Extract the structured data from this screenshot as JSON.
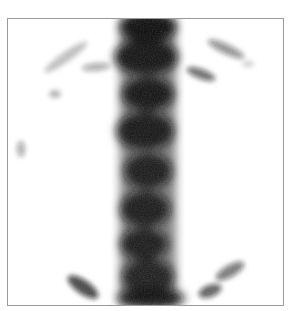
{
  "image": {
    "description": "Grayscale nuclear medicine scintigraphy (bone scan) showing a vertical spine with vertebral uptake and faint rib arcs",
    "colors": {
      "background": "#ffffff",
      "border": "#9a9a9a",
      "uptake": "#111111"
    }
  },
  "scan": {
    "vertebrae": [
      {
        "cx": 140,
        "cy": 8,
        "rx": 28,
        "ry": 16,
        "o": 0.95
      },
      {
        "cx": 138,
        "cy": 38,
        "rx": 32,
        "ry": 18,
        "o": 0.9
      },
      {
        "cx": 140,
        "cy": 75,
        "rx": 26,
        "ry": 17,
        "o": 0.9
      },
      {
        "cx": 137,
        "cy": 112,
        "rx": 29,
        "ry": 19,
        "o": 0.88
      },
      {
        "cx": 140,
        "cy": 152,
        "rx": 24,
        "ry": 18,
        "o": 0.85
      },
      {
        "cx": 137,
        "cy": 190,
        "rx": 25,
        "ry": 18,
        "o": 0.85
      },
      {
        "cx": 136,
        "cy": 225,
        "rx": 24,
        "ry": 16,
        "o": 0.85
      },
      {
        "cx": 140,
        "cy": 258,
        "rx": 26,
        "ry": 18,
        "o": 0.82
      },
      {
        "cx": 143,
        "cy": 279,
        "rx": 34,
        "ry": 10,
        "o": 0.9
      }
    ],
    "ribs": [
      {
        "cx": 58,
        "cy": 38,
        "rx": 26,
        "ry": 5,
        "rot": -35,
        "o": 0.25
      },
      {
        "cx": 88,
        "cy": 48,
        "rx": 14,
        "ry": 4,
        "rot": -5,
        "o": 0.35
      },
      {
        "cx": 47,
        "cy": 75,
        "rx": 6,
        "ry": 4,
        "rot": 0,
        "o": 0.3
      },
      {
        "cx": 13,
        "cy": 130,
        "rx": 4,
        "ry": 8,
        "rot": 0,
        "o": 0.35
      },
      {
        "cx": 218,
        "cy": 30,
        "rx": 20,
        "ry": 5,
        "rot": 25,
        "o": 0.45
      },
      {
        "cx": 193,
        "cy": 55,
        "rx": 15,
        "ry": 5,
        "rot": 20,
        "o": 0.6
      },
      {
        "cx": 240,
        "cy": 45,
        "rx": 6,
        "ry": 3,
        "rot": 0,
        "o": 0.2
      },
      {
        "cx": 75,
        "cy": 268,
        "rx": 18,
        "ry": 7,
        "rot": 35,
        "o": 0.75
      },
      {
        "cx": 222,
        "cy": 252,
        "rx": 16,
        "ry": 6,
        "rot": -30,
        "o": 0.55
      },
      {
        "cx": 202,
        "cy": 272,
        "rx": 12,
        "ry": 6,
        "rot": -20,
        "o": 0.65
      }
    ]
  }
}
